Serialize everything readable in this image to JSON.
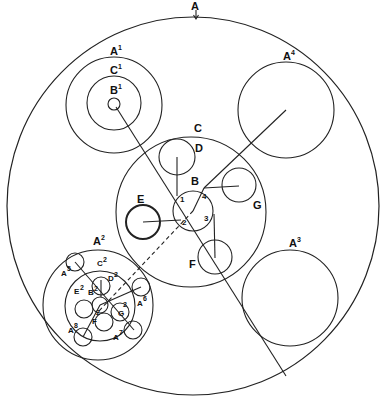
{
  "diagram": {
    "labels": {
      "A": "A",
      "A1": "A",
      "A1_sup": "1",
      "C1": "C",
      "C1_sup": "1",
      "B1": "B",
      "B1_sup": "1",
      "A4": "A",
      "A4_sup": "4",
      "C": "C",
      "D": "D",
      "B": "B",
      "E": "E",
      "G": "G",
      "F": "F",
      "A3": "A",
      "A3_sup": "3",
      "A2": "A",
      "A2_sup": "2",
      "C2": "C",
      "C2_sup": "2",
      "D2": "D",
      "D2_sup": "2",
      "B2": "B",
      "B2_sup": "2",
      "E2": "E",
      "E2_sup": "2",
      "F2": "F",
      "F2_sup": "2",
      "G2": "G",
      "G2_sup": "2",
      "A5": "A",
      "A5_sup": "5",
      "A6": "A",
      "A6_sup": "6",
      "A7": "A",
      "A7_sup": "7",
      "A8": "A",
      "A8_sup": "8"
    },
    "points": [
      "1",
      "2",
      "3",
      "4"
    ],
    "arrow": "↓"
  }
}
